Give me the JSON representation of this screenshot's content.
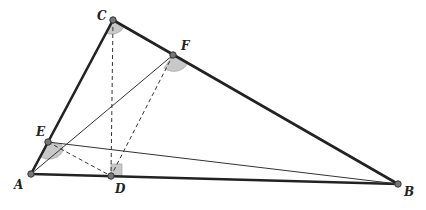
{
  "diagram": {
    "type": "geometry",
    "points": {
      "A": {
        "label": "A",
        "x": 31,
        "y": 174
      },
      "B": {
        "label": "B",
        "x": 398,
        "y": 184
      },
      "C": {
        "label": "C",
        "x": 113,
        "y": 20
      },
      "D": {
        "label": "D",
        "x": 111,
        "y": 176
      },
      "E": {
        "label": "E",
        "x": 48,
        "y": 142
      },
      "F": {
        "label": "F",
        "x": 173,
        "y": 55
      }
    },
    "segments": {
      "thick": [
        "AC",
        "CB",
        "AB"
      ],
      "thin": [
        "AF",
        "EB"
      ],
      "dashed": [
        "CD",
        "ED",
        "FD"
      ]
    },
    "angle_marks": [
      "C",
      "F",
      "E"
    ],
    "right_angle_marks": [
      "D"
    ]
  }
}
